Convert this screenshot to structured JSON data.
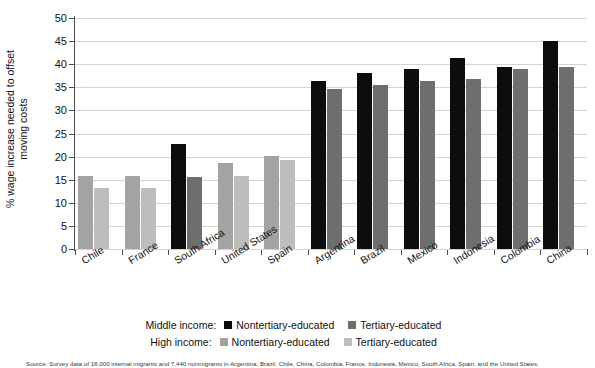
{
  "chart_data": {
    "type": "bar",
    "title": "",
    "xlabel": "",
    "ylabel": "% wage increase needed to offset moving costs",
    "ylabel_lines": [
      "% wage increase needed to offset",
      "moving costs"
    ],
    "ylim": [
      0,
      50
    ],
    "ytick_step": 5,
    "yticks": [
      0,
      5,
      10,
      15,
      20,
      25,
      30,
      35,
      40,
      45,
      50
    ],
    "grid": true,
    "grid_axis": "y",
    "legend_position": "bottom",
    "categories": [
      "Chile",
      "France",
      "South Africa",
      "United States",
      "Spain",
      "Argentina",
      "Brazil",
      "Mexico",
      "Indonesia",
      "Colombia",
      "China"
    ],
    "income_group": [
      "high",
      "high",
      "middle",
      "high",
      "high",
      "middle",
      "middle",
      "middle",
      "middle",
      "middle",
      "middle"
    ],
    "series": [
      {
        "name": "Nontertiary-educated",
        "values": [
          15.8,
          15.8,
          22.8,
          18.7,
          20.1,
          36.3,
          38.1,
          39.0,
          41.3,
          39.5,
          45.0
        ]
      },
      {
        "name": "Tertiary-educated",
        "values": [
          13.1,
          13.2,
          15.6,
          15.7,
          19.3,
          34.7,
          35.6,
          36.3,
          36.7,
          39.0,
          39.5
        ]
      }
    ],
    "colors": {
      "middle_nontertiary": "#0d0d0d",
      "middle_tertiary": "#6e6e6e",
      "high_nontertiary": "#a3a3a3",
      "high_tertiary": "#bdbdbd",
      "gridline": "#d3d3d3",
      "axis": "#4d4d4d"
    }
  },
  "legend": {
    "rows": [
      {
        "title": "Middle income:",
        "items": [
          {
            "label": "Nontertiary-educated",
            "color": "#0d0d0d"
          },
          {
            "label": "Tertiary-educated",
            "color": "#6e6e6e"
          }
        ]
      },
      {
        "title": "High income:",
        "items": [
          {
            "label": "Nontertiary-educated",
            "color": "#a3a3a3"
          },
          {
            "label": "Tertiary-educated",
            "color": "#bdbdbd"
          }
        ]
      }
    ]
  },
  "footnote": {
    "text": "Source: Survey data of 18,000 internal migrants and 7,440 nonmigrants in Argentina, Brazil, Chile, China, Colombia, France, Indonesia, Mexico, South Africa, Spain, and the United States."
  }
}
